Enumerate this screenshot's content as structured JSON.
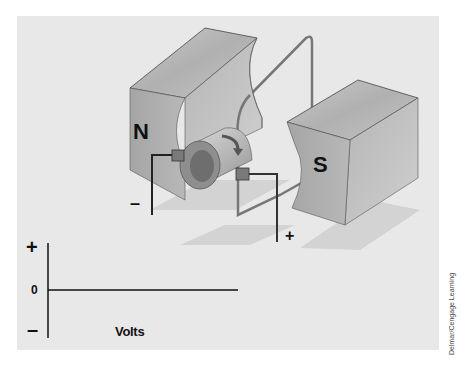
{
  "figure": {
    "labels": {
      "north_pole": "N",
      "south_pole": "S",
      "negative_terminal": "–",
      "positive_terminal": "+"
    },
    "graph": {
      "y_positive": "+",
      "y_zero": "0",
      "y_negative": "–",
      "x_label": "Volts"
    },
    "credit": "Delmar/Cengage Learning",
    "colors": {
      "background": "#ffffff",
      "panel": "#e8e8e8",
      "magnet_top": "#b9b9b9",
      "magnet_front": "#a9a9a9",
      "magnet_side": "#c4c4c4",
      "wire": "#777777",
      "lead": "#222222",
      "shadow": "#d2d2d2"
    }
  }
}
